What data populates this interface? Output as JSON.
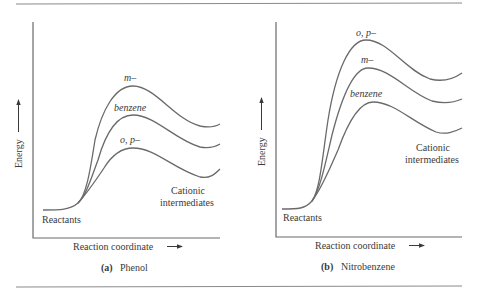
{
  "figure": {
    "panels": [
      {
        "id": "a",
        "caption_letter": "(a)",
        "caption_text": "Phenol",
        "y_axis_label": "Energy",
        "x_axis_label": "Reaction coordinate",
        "start_label": "Reactants",
        "end_label_line1": "Cationic",
        "end_label_line2": "intermediates",
        "curves": [
          {
            "name": "m-",
            "label": "m–",
            "rank": 1
          },
          {
            "name": "benzene",
            "label": "benzene",
            "rank": 2
          },
          {
            "name": "o,p-",
            "label": "o, p–",
            "rank": 3
          }
        ]
      },
      {
        "id": "b",
        "caption_letter": "(b)",
        "caption_text": "Nitrobenzene",
        "y_axis_label": "Energy",
        "x_axis_label": "Reaction coordinate",
        "start_label": "Reactants",
        "end_label_line1": "Cationic",
        "end_label_line2": "intermediates",
        "curves": [
          {
            "name": "o,p-",
            "label": "o, p–",
            "rank": 1
          },
          {
            "name": "m-",
            "label": "m–",
            "rank": 2
          },
          {
            "name": "benzene",
            "label": "benzene",
            "rank": 3
          }
        ]
      }
    ],
    "colors": {
      "line": "#6a6a6a",
      "text": "#3a3a3a",
      "rule": "#8a8a8a",
      "background": "#ffffff"
    }
  }
}
